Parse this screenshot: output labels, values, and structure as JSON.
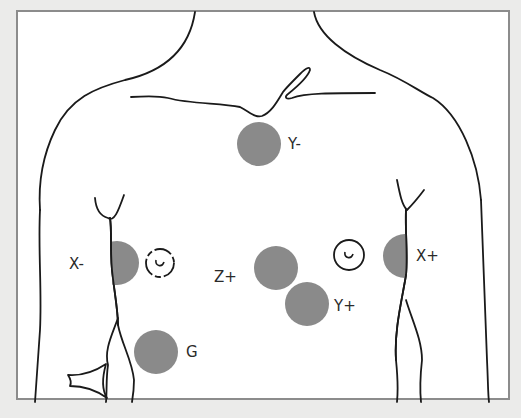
{
  "diagram": {
    "colors": {
      "background": "#ebebea",
      "frame_fill": "#ffffff",
      "frame_border": "#8c8c8c",
      "outline": "#1a1a1a",
      "electrode": "#8a8a8a",
      "label": "#2a2a2a"
    },
    "electrodes": [
      {
        "id": "y-minus",
        "label": "Y-",
        "cx": 259,
        "cy": 144,
        "r": 22
      },
      {
        "id": "x-minus",
        "label": "X-",
        "cx": 117,
        "cy": 263,
        "r": 22
      },
      {
        "id": "z-plus",
        "label": "Z+",
        "cx": 276,
        "cy": 268,
        "r": 22
      },
      {
        "id": "x-plus",
        "label": "X+",
        "cx": 405,
        "cy": 256,
        "r": 22
      },
      {
        "id": "y-plus",
        "label": "Y+",
        "cx": 307,
        "cy": 304,
        "r": 22
      },
      {
        "id": "g",
        "label": "G",
        "cx": 156,
        "cy": 352,
        "r": 22
      }
    ],
    "labels": [
      {
        "id": "y-minus",
        "text": "Y-",
        "x": 288,
        "y": 137
      },
      {
        "id": "x-minus",
        "text": "X-",
        "x": 69,
        "y": 257
      },
      {
        "id": "z-plus",
        "text": "Z+",
        "x": 214,
        "y": 270
      },
      {
        "id": "x-plus",
        "text": "X+",
        "x": 416,
        "y": 249
      },
      {
        "id": "y-plus",
        "text": "Y+",
        "x": 334,
        "y": 299
      },
      {
        "id": "g",
        "text": "G",
        "x": 186,
        "y": 345
      }
    ],
    "nipples": [
      {
        "side": "right-of-patient",
        "cx": 160,
        "cy": 263
      },
      {
        "side": "left-of-patient",
        "cx": 349,
        "cy": 255
      }
    ]
  }
}
